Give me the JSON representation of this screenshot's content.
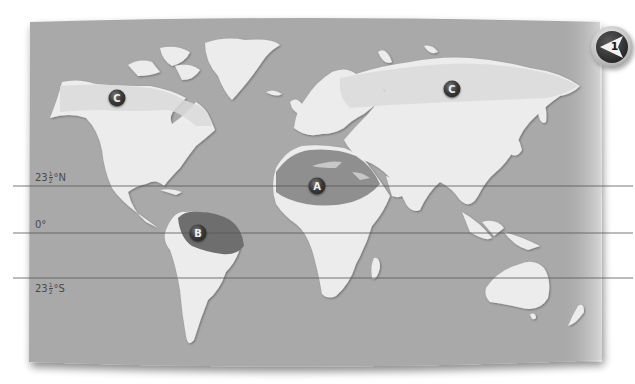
{
  "map": {
    "type": "world-map",
    "colors": {
      "ocean": "#a9a9a9",
      "land": "#ececec",
      "zone_a": "#8f8f8f",
      "zone_b": "#6e6e6e",
      "zone_c": "#dcdcdc",
      "lines": "#555555"
    },
    "latitude_lines": [
      {
        "label_main": "23",
        "label_num": "1",
        "label_den": "2",
        "label_suffix": "°N",
        "y": 186
      },
      {
        "label_main": "0°",
        "label_num": "",
        "label_den": "",
        "label_suffix": "",
        "y": 233
      },
      {
        "label_main": "23",
        "label_num": "1",
        "label_den": "2",
        "label_suffix": "°S",
        "y": 278
      }
    ],
    "markers": [
      {
        "id": "A",
        "label": "A",
        "region": "Sahara / North Africa"
      },
      {
        "id": "B",
        "label": "B",
        "region": "Amazon basin"
      },
      {
        "id": "C1",
        "label": "C",
        "region": "Northern North America"
      },
      {
        "id": "C2",
        "label": "C",
        "region": "Northern Eurasia"
      }
    ],
    "badge": {
      "number": "1",
      "icon": "left-arrow-badge-icon"
    }
  }
}
